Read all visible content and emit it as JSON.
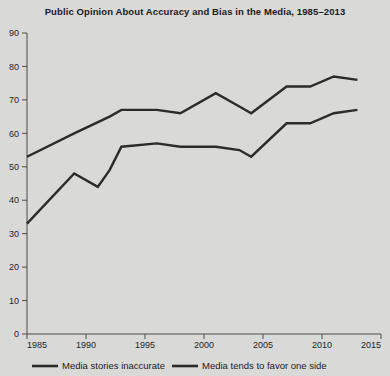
{
  "chart_data": {
    "type": "line",
    "title": "Public Opinion About Accuracy and Bias in the Media, 1985–2013",
    "xlabel": "",
    "ylabel": "",
    "xlim": [
      1985,
      2015
    ],
    "ylim": [
      0,
      90
    ],
    "grid": false,
    "legend_position": "bottom",
    "x_ticks": [
      "1985",
      "1990",
      "1995",
      "2000",
      "2005",
      "2010",
      "2015"
    ],
    "x_tick_values": [
      1985,
      1990,
      1995,
      2000,
      2005,
      2010,
      2015
    ],
    "y_ticks": [
      "0",
      "10",
      "20",
      "30",
      "40",
      "50",
      "60",
      "70",
      "80",
      "90"
    ],
    "y_tick_values": [
      0,
      10,
      20,
      30,
      40,
      50,
      60,
      70,
      80,
      90
    ],
    "series": [
      {
        "name": "Media stories inaccurate",
        "color": "#2b2b2b",
        "x": [
          1985,
          1989,
          1991,
          1992,
          1993,
          1996,
          1998,
          2001,
          2003,
          2004,
          2007,
          2009,
          2011,
          2013
        ],
        "values": [
          33,
          48,
          44,
          49,
          56,
          57,
          56,
          56,
          55,
          53,
          63,
          63,
          66,
          67
        ]
      },
      {
        "name": "Media tends to favor one side",
        "color": "#2b2b2b",
        "x": [
          1985,
          1989,
          1992,
          1993,
          1996,
          1998,
          2001,
          2003,
          2004,
          2007,
          2009,
          2011,
          2013
        ],
        "values": [
          53,
          60,
          65,
          67,
          67,
          66,
          72,
          68,
          66,
          74,
          74,
          77,
          76
        ]
      }
    ]
  },
  "legend": {
    "items": [
      {
        "label": "Media stories inaccurate"
      },
      {
        "label": "Media tends to favor one side"
      }
    ]
  }
}
